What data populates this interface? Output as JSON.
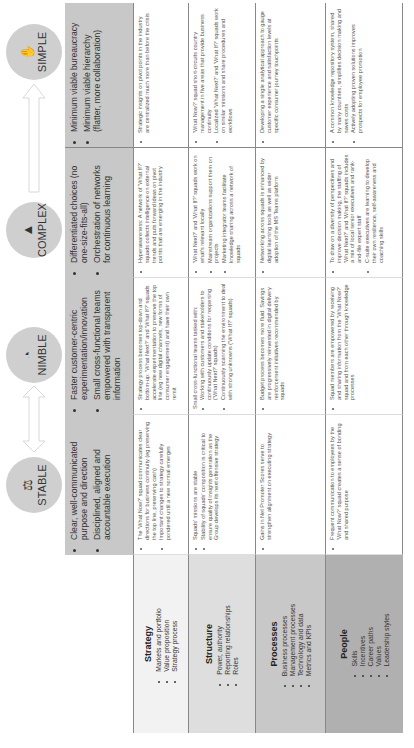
{
  "columns": [
    {
      "key": "stable",
      "label": "STABLE",
      "icon": "balance-icon",
      "header_points": [
        "Clear, well-communicated purpose and direction",
        "Disciplined, aligned and accountable execution"
      ]
    },
    {
      "key": "nimble",
      "label": "NIMBLE",
      "icon": "stopwatch-icon",
      "header_points": [
        "Faster customer-centric experimentation/innovation",
        "Small cross-functional teams empowered with transparent information"
      ]
    },
    {
      "key": "complex",
      "label": "COMPLEX",
      "icon": "triangle-icon",
      "header_points": [
        "Differentiated choices (no one-size-fits-all)",
        "Orchestration of networks for continuous learning"
      ]
    },
    {
      "key": "simple",
      "label": "SIMPLE",
      "icon": "hand-icon",
      "header_points": [
        "Minimum viable bureaucracy",
        "Minimum viable hierarchy (flatter, more collaboration)"
      ]
    }
  ],
  "rows": [
    {
      "title": "Strategy",
      "items": [
        "Markets and portfolio",
        "Value proposition",
        "Strategy process"
      ],
      "color": "#f2f2f2",
      "cells": {
        "stable": {
          "pre": "",
          "points": [
            "The 'What Now?' squad communicates clear directions for business continuity (eg preserving the top line, preserving cash)",
            "Important changes to strategy carefully pondered until a new normal emerges"
          ]
        },
        "nimble": {
          "pre": "",
          "points": [
            "Strategy process becomes top-down and bottom-up: 'What Next?' and 'What If?' squads accelerate experimentation to preserve the top line (eg new digital channels, new forms of consumer engagement) and have their own remit"
          ]
        },
        "complex": {
          "pre": "",
          "points": [
            "Hyperawareness: A network of 'What If?' squads collects intelligence on external trends and puts forward ideas on pivot points that are emerging in the industry"
          ]
        },
        "simple": {
          "pre": "",
          "points": [
            "Strategic insights on pivot points in the industry are centralized much more than before the crisis"
          ]
        }
      }
    },
    {
      "title": "Structure",
      "items": [
        "Power, authority",
        "Reporting relationships",
        "Roles"
      ],
      "color": "#dedede",
      "cells": {
        "stable": {
          "pre": "",
          "points": [
            "Squads' missions are stable",
            "Stability of squads' composition is critical to ensure quality of insights generation as the Group develops its next offensive strategy"
          ]
        },
        "nimble": {
          "pre": "Small cross-functional teams tasked with:",
          "points": [
            "Working with customers and stakeholders to continuously update conditions for reopening ('What Next?' squads)",
            "Continuously scanning the environment to deal with strong unknowns ('What If?' squads)"
          ]
        },
        "complex": {
          "pre": "",
          "points": [
            "'What Next?' and 'What If?' squads work on what's relevant locally",
            "Mainstream organizations support them on projects",
            "Marketing integrator teams facilitate knowledge sharing across a network of squads"
          ]
        },
        "simple": {
          "pre": "",
          "points": [
            "'What Now?' squad short-circuits country management in five areas that provide business continuity",
            "Localized 'What Next?' and 'What If?' squads work on similar missions and share procedures and workflows"
          ]
        }
      }
    },
    {
      "title": "Processes",
      "items": [
        "Business processes",
        "Management processes",
        "Technology and data",
        "Metrics and KPIs"
      ],
      "color": "#c8c8c8",
      "cells": {
        "stable": {
          "pre": "",
          "points": [
            "Gains in Net Promoter Scores serve to strengthen alignment on executing strategy"
          ]
        },
        "nimble": {
          "pre": "",
          "points": [
            "Budget process becomes more fluid: Savings are progressively reinvested in digital delivery reinforcement initiatives recommended by squads"
          ]
        },
        "complex": {
          "pre": "",
          "points": [
            "Networking across squads is enhanced by digital learning tools as well as wider adoption of the MS Teams platform"
          ]
        },
        "simple": {
          "pre": "",
          "points": [
            "Developing a single analytical approach to gauge customer experience and satisfaction levels at specific consumer journey touchpoints"
          ]
        }
      }
    },
    {
      "title": "People",
      "items": [
        "Skills",
        "Incentives",
        "Career paths",
        "Values",
        "Leadership styles"
      ],
      "color": "#b0b0b0",
      "cells": {
        "stable": {
          "pre": "",
          "points": [
            "Frequent communication to employees by the 'What Now?' squad creates a sense of bonding and shared purpose"
          ]
        },
        "nimble": {
          "pre": "",
          "points": [
            "Squad members are empowered by receiving and sharing information from the 'What Now?' squad and from each other through knowledge processes"
          ]
        },
        "complex": {
          "pre": "",
          "points": [
            "To draw on a diversity of perspectives and improve decision making, the staffing of 'What Next?' and 'What If?' squads includes a mix of local senior executives and rank-and-file expert staff",
            "C-suite executives are learning to develop their own resilience, self-awareness and coaching skills"
          ]
        },
        "simple": {
          "pre": "",
          "points": [
            "A common knowledge repository system, shared by many countries, simplifies decision making and saves costs",
            "Actively adopting proven solutions improves prospects for employee promotion"
          ]
        }
      }
    }
  ],
  "colors": {
    "header_bg": "#c8c8c8",
    "circle_bg": "#cfcfcf",
    "arrow": "#e6e6e6",
    "rule": "#888888"
  }
}
